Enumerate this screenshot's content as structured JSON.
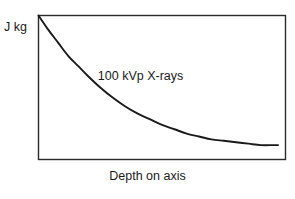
{
  "figure": {
    "y_axis_label": "J kg",
    "x_axis_label": "Depth on axis",
    "curve_annotation": "100 kVp X-rays",
    "frame_color": "#2b2b2b",
    "curve_color": "#1a1a1a",
    "background_color": "#ffffff",
    "text_color": "#1a1a1a"
  },
  "chart_data": {
    "type": "line",
    "title": "",
    "subtitle": "",
    "xlabel": "Depth on axis",
    "ylabel": "J kg",
    "grid": false,
    "legend": null,
    "annotations": [
      {
        "text": "100 kVp X-rays",
        "x": 0.24,
        "y": 0.62
      }
    ],
    "axis_ticks": {
      "x": [],
      "y": []
    },
    "xlim": [
      0,
      1
    ],
    "ylim": [
      0,
      1
    ],
    "series": [
      {
        "name": "100 kVp X-rays depth dose",
        "x": [
          0.0,
          0.04,
          0.08,
          0.12,
          0.16,
          0.2,
          0.25,
          0.3,
          0.35,
          0.4,
          0.45,
          0.5,
          0.55,
          0.6,
          0.65,
          0.7,
          0.75,
          0.8,
          0.85,
          0.9,
          0.95,
          0.97
        ],
        "y": [
          1.0,
          0.9,
          0.81,
          0.72,
          0.65,
          0.58,
          0.5,
          0.43,
          0.37,
          0.32,
          0.28,
          0.24,
          0.21,
          0.18,
          0.16,
          0.14,
          0.13,
          0.12,
          0.11,
          0.1,
          0.1,
          0.1
        ]
      }
    ]
  }
}
